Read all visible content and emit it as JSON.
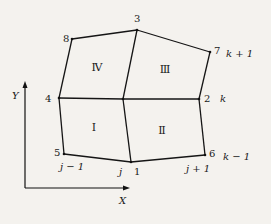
{
  "diagram": {
    "nodes": [
      {
        "id": "1",
        "x": 131,
        "y": 162,
        "label": "1",
        "lx": 134,
        "ly": 175
      },
      {
        "id": "2",
        "x": 199,
        "y": 99,
        "label": "2",
        "lx": 204,
        "ly": 102
      },
      {
        "id": "3",
        "x": 137,
        "y": 30,
        "label": "3",
        "lx": 134,
        "ly": 22
      },
      {
        "id": "4",
        "x": 59,
        "y": 98,
        "label": "4",
        "lx": 45,
        "ly": 102
      },
      {
        "id": "5",
        "x": 64,
        "y": 154,
        "label": "5",
        "lx": 54,
        "ly": 156
      },
      {
        "id": "6",
        "x": 205,
        "y": 155,
        "label": "6",
        "lx": 209,
        "ly": 157
      },
      {
        "id": "7",
        "x": 210,
        "y": 52,
        "label": "7",
        "lx": 214,
        "ly": 54
      },
      {
        "id": "8",
        "x": 72,
        "y": 39,
        "label": "8",
        "lx": 63,
        "ly": 42
      },
      {
        "id": "c",
        "x": 123,
        "y": 99,
        "label": "",
        "lx": 0,
        "ly": 0
      }
    ],
    "edges": [
      [
        "8",
        "3"
      ],
      [
        "3",
        "7"
      ],
      [
        "7",
        "2"
      ],
      [
        "2",
        "6"
      ],
      [
        "6",
        "1"
      ],
      [
        "1",
        "5"
      ],
      [
        "5",
        "4"
      ],
      [
        "4",
        "8"
      ],
      [
        "3",
        "c"
      ],
      [
        "c",
        "1"
      ],
      [
        "4",
        "c"
      ],
      [
        "c",
        "2"
      ]
    ],
    "regions": [
      {
        "label": "Ⅰ",
        "x": 94,
        "y": 131
      },
      {
        "label": "Ⅱ",
        "x": 162,
        "y": 134
      },
      {
        "label": "Ⅲ",
        "x": 165,
        "y": 73
      },
      {
        "label": "Ⅳ",
        "x": 97,
        "y": 71
      }
    ],
    "index_labels": [
      {
        "text": "k + 1",
        "x": 226,
        "y": 57
      },
      {
        "text": "k",
        "x": 220,
        "y": 102
      },
      {
        "text": "k − 1",
        "x": 223,
        "y": 160
      },
      {
        "text": "j − 1",
        "x": 60,
        "y": 170
      },
      {
        "text": "j",
        "x": 119,
        "y": 175
      },
      {
        "text": "j + 1",
        "x": 186,
        "y": 172
      }
    ],
    "axes": {
      "x_label": "X",
      "y_label": "Y",
      "origin": {
        "x": 25,
        "y": 188
      },
      "x_end": 126,
      "y_end": 85
    }
  }
}
